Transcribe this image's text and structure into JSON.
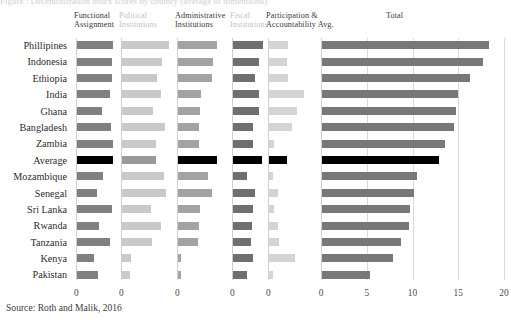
{
  "figure": {
    "source_note": "Source: Roth and Malik, 2016",
    "top_clipped_text": "Figure : Decentralization index scores by country (average of dimensions)"
  },
  "colors": {
    "functional_assignment": "#808080",
    "political_institutions": "#c9c9c9",
    "administrative_institutions": "#a3a3a3",
    "fiscal_institutions": "#6f6f6f",
    "participation_accountability": "#d4d4d4",
    "total": "#787878",
    "highlight_average": "#000000",
    "gridline": "#dadada",
    "axis": "#cfcfcf"
  },
  "countries": [
    "Phillipines",
    "Indonesia",
    "Ethiopia",
    "India",
    "Ghana",
    "Bangladesh",
    "Zambia",
    "Average",
    "Mozambique",
    "Senegal",
    "Sri Lanka",
    "Rwanda",
    "Tanzania",
    "Kenya",
    "Pakistan"
  ],
  "highlight_row": "Average",
  "panels": [
    {
      "key": "functional_assignment",
      "title_line1": "Functional",
      "title_line2": "Assignment",
      "head_style": "dark",
      "zero_label": "0",
      "max": 4
    },
    {
      "key": "political_institutions",
      "title_line1": "Political",
      "title_line2": "Institutions",
      "head_style": "light",
      "zero_label": "0",
      "max": 4
    },
    {
      "key": "administrative_institutions",
      "title_line1": "Administrative",
      "title_line2": "Institutions",
      "head_style": "dark",
      "zero_label": "0",
      "max": 4
    },
    {
      "key": "fiscal_institutions",
      "title_line1": "Fiscal",
      "title_line2": "Institutions",
      "head_style": "light",
      "zero_label": "0",
      "max": 4
    },
    {
      "key": "participation_accountability",
      "title_line1": "Participation &",
      "title_line2": "Accountability Avg.",
      "head_style": "dark",
      "zero_label": "0",
      "max": 4
    }
  ],
  "total_panel": {
    "key": "total",
    "title_line1": "Total",
    "title_line2": "",
    "head_style": "total",
    "ticks": [
      "0",
      "5",
      "10",
      "15",
      "20"
    ],
    "tick_values": [
      0,
      5,
      10,
      15,
      20
    ],
    "xlim": [
      0,
      20
    ]
  },
  "chart_data": {
    "type": "bar",
    "subtitle": "",
    "xlabel": "",
    "ylabel": "",
    "orientation": "horizontal",
    "grid": true,
    "legend_position": "none",
    "panel_layout": "small-multiples + total",
    "categories": [
      "Phillipines",
      "Indonesia",
      "Ethiopia",
      "India",
      "Ghana",
      "Bangladesh",
      "Zambia",
      "Average",
      "Mozambique",
      "Senegal",
      "Sri Lanka",
      "Rwanda",
      "Tanzania",
      "Kenya",
      "Pakistan"
    ],
    "series": [
      {
        "name": "Functional Assignment",
        "xlim": [
          0,
          4
        ],
        "values": [
          3.4,
          3.3,
          3.3,
          3.1,
          2.4,
          3.2,
          3.4,
          3.4,
          2.5,
          1.9,
          3.3,
          2.1,
          3.1,
          1.6,
          2.0
        ]
      },
      {
        "name": "Political Institutions",
        "xlim": [
          0,
          4
        ],
        "values": [
          3.6,
          3.1,
          2.7,
          3.0,
          2.4,
          3.3,
          2.6,
          2.6,
          3.2,
          3.4,
          2.2,
          3.0,
          2.3,
          0.7,
          0.6
        ]
      },
      {
        "name": "Administrative Institutions",
        "xlim": [
          0,
          4
        ],
        "values": [
          3.0,
          2.7,
          2.6,
          1.8,
          1.7,
          1.6,
          1.6,
          3.0,
          2.3,
          2.6,
          1.7,
          1.6,
          1.5,
          0.2,
          0.2
        ]
      },
      {
        "name": "Fiscal Institutions",
        "xlim": [
          0,
          4
        ],
        "values": [
          3.5,
          3.0,
          2.6,
          3.1,
          3.0,
          2.3,
          2.3,
          3.4,
          1.7,
          2.6,
          2.4,
          2.2,
          2.1,
          2.3,
          1.6
        ]
      },
      {
        "name": "Participation & Accountability Avg.",
        "xlim": [
          0,
          4
        ],
        "values": [
          1.5,
          1.4,
          1.5,
          2.8,
          2.2,
          1.8,
          0.4,
          1.4,
          0.3,
          0.7,
          0.4,
          0.7,
          0.8,
          2.1,
          0.3
        ]
      },
      {
        "name": "Total",
        "xlim": [
          0,
          20
        ],
        "values": [
          18.2,
          17.6,
          16.2,
          14.9,
          14.6,
          14.4,
          13.4,
          12.8,
          10.4,
          10.1,
          9.6,
          9.5,
          8.6,
          7.8,
          5.2
        ]
      }
    ]
  }
}
